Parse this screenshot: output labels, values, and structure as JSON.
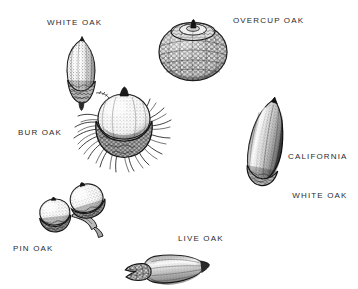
{
  "figure": {
    "kind": "botanical-illustration",
    "background_color": "#ffffff",
    "ink_color": "#2b2b2b",
    "width": 358,
    "height": 289
  },
  "labels": {
    "white_oak": "WHITE OAK",
    "overcup_oak": "OVERCUP OAK",
    "bur_oak": "BUR OAK",
    "california_white_oak_line1": "CALIFORNIA",
    "california_white_oak_line2": "WHITE OAK",
    "pin_oak": "PIN OAK",
    "live_oak": "LIVE OAK"
  },
  "specimens": [
    {
      "id": "white-oak",
      "label": "WHITE OAK",
      "description": "Elongated oval nut with pointed tip, shallow bowl-shaped scaly cup at base",
      "label_position": "above-left"
    },
    {
      "id": "overcup-oak",
      "label": "OVERCUP OAK",
      "description": "Nearly spherical nut almost wholly enclosed by a thick warty scaled cup, small nipple at apex",
      "label_position": "right"
    },
    {
      "id": "bur-oak",
      "label": "BUR OAK",
      "description": "Large broad nut set in a deep cup with a conspicuous mossy fringe of bristles",
      "label_position": "left"
    },
    {
      "id": "california-white-oak",
      "label": "CALIFORNIA WHITE OAK",
      "description": "Long slender tapering conical nut with shallow cup, shown tilted",
      "label_position": "right"
    },
    {
      "id": "pin-oak",
      "label": "PIN OAK",
      "description": "Pair of small nearly round nuts on a short stalk with thin saucer-like cups",
      "label_position": "below-left"
    },
    {
      "id": "live-oak",
      "label": "LIVE OAK",
      "description": "Narrow elongate tapering nut lying horizontally with scaly cup at one end",
      "label_position": "above"
    }
  ]
}
